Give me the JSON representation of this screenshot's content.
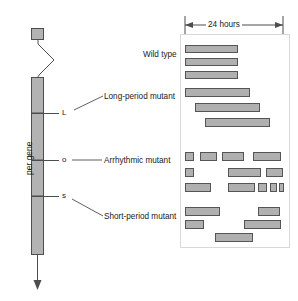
{
  "figure": {
    "gene_label": "per gene",
    "scale_label": "24 hours",
    "colors": {
      "bar_fill": "#b3b3b3",
      "bar_stroke": "#4d4d4d",
      "activity_fill": "#b0b0b0",
      "activity_stroke": "#555555",
      "panel_border": "#d9d9d9",
      "text": "#1a1a1a"
    }
  },
  "gene": {
    "label": "per gene",
    "markers": [
      {
        "symbol": "L",
        "name": "long-period-allele",
        "y": 113
      },
      {
        "symbol": "o",
        "name": "arrhythmic-allele",
        "y": 160
      },
      {
        "symbol": "s",
        "name": "short-period-allele",
        "y": 196
      }
    ]
  },
  "callouts": [
    {
      "id": "wild-type",
      "text": "Wild type"
    },
    {
      "id": "long-period",
      "text": "Long-period mutant"
    },
    {
      "id": "arrhythmic",
      "text": "Arrhythmic mutant"
    },
    {
      "id": "short-period",
      "text": "Short-period mutant"
    }
  ],
  "scale": {
    "label": "24 hours",
    "x_start": 185,
    "x_end": 283
  },
  "actograms": [
    {
      "id": "wild-type",
      "label": "Wild type",
      "rows": [
        [
          {
            "x": 185,
            "w": 53
          }
        ],
        [
          {
            "x": 185,
            "w": 53
          }
        ],
        [
          {
            "x": 185,
            "w": 53
          }
        ]
      ]
    },
    {
      "id": "long-period",
      "label": "Long-period mutant",
      "rows": [
        [
          {
            "x": 185,
            "w": 65
          }
        ],
        [
          {
            "x": 195,
            "w": 65
          }
        ],
        [
          {
            "x": 205,
            "w": 65
          }
        ]
      ]
    },
    {
      "id": "arrhythmic",
      "label": "Arrhythmic mutant",
      "rows": [
        [
          {
            "x": 185,
            "w": 9
          },
          {
            "x": 200,
            "w": 17
          },
          {
            "x": 222,
            "w": 22
          },
          {
            "x": 253,
            "w": 28
          }
        ],
        [
          {
            "x": 185,
            "w": 9
          },
          {
            "x": 228,
            "w": 33
          },
          {
            "x": 266,
            "w": 17
          }
        ],
        [
          {
            "x": 185,
            "w": 26
          },
          {
            "x": 228,
            "w": 27
          },
          {
            "x": 258,
            "w": 9
          },
          {
            "x": 270,
            "w": 7
          },
          {
            "x": 279,
            "w": 5
          }
        ]
      ]
    },
    {
      "id": "short-period",
      "label": "Short-period mutant",
      "rows": [
        [
          {
            "x": 185,
            "w": 35
          },
          {
            "x": 258,
            "w": 22
          }
        ],
        [
          {
            "x": 185,
            "w": 19
          },
          {
            "x": 244,
            "w": 37
          }
        ],
        [
          {
            "x": 215,
            "w": 38
          }
        ]
      ]
    }
  ]
}
